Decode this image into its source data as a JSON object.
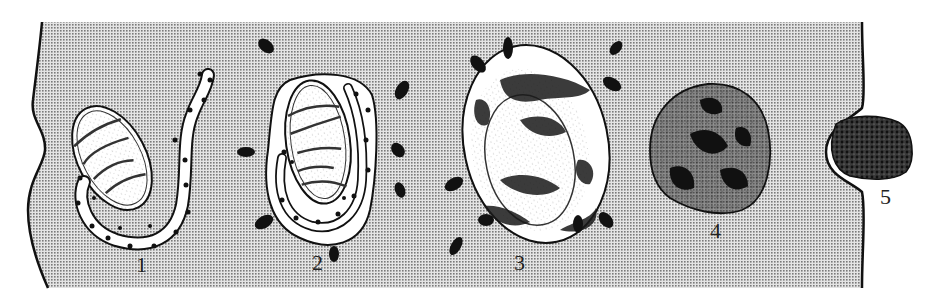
{
  "diagram": {
    "type": "biology-illustration",
    "colors": {
      "cytoplasm_dots": "#8a8a8a",
      "cytoplasm_bg": "#d9d9d9",
      "outline": "#111111",
      "organelle_fill": "#ffffff",
      "dense": "#151515"
    },
    "stages": [
      {
        "id": 1,
        "label": "1",
        "description": "mitochondrion approached by curved ribosome-studded membrane (phagophore)"
      },
      {
        "id": 2,
        "label": "2",
        "description": "membrane encloses mitochondrion forming autophagosome"
      },
      {
        "id": 3,
        "label": "3",
        "description": "fusion with lysosomes; contents being digested"
      },
      {
        "id": 4,
        "label": "4",
        "description": "residual body with dense material"
      },
      {
        "id": 5,
        "label": "5",
        "description": "exocytosis of residual body at cell membrane"
      }
    ]
  }
}
